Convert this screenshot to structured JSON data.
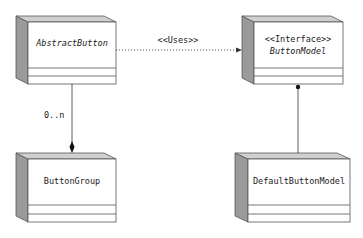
{
  "diagram": {
    "type": "UML class diagram",
    "classes": [
      {
        "id": "abstract-button",
        "name": "AbstractButton",
        "stereotype": "",
        "italic": true
      },
      {
        "id": "button-model",
        "name": "ButtonModel",
        "stereotype": "<<Interface>>",
        "italic": true
      },
      {
        "id": "button-group",
        "name": "ButtonGroup",
        "stereotype": "",
        "italic": false
      },
      {
        "id": "default-button-model",
        "name": "DefaultButtonModel",
        "stereotype": "",
        "italic": false
      }
    ],
    "relations": [
      {
        "id": "uses",
        "from": "AbstractButton",
        "to": "ButtonModel",
        "kind": "dependency",
        "label": "<<Uses>>"
      },
      {
        "id": "group-aggregation",
        "from": "AbstractButton",
        "to": "ButtonGroup",
        "kind": "composition",
        "label": "0..n"
      },
      {
        "id": "model-realization",
        "from": "DefaultButtonModel",
        "to": "ButtonModel",
        "kind": "association",
        "label": ""
      }
    ],
    "colors": {
      "box_fill": "#ffffff",
      "box_stroke": "#555555",
      "side_face": "#9a9a9a",
      "top_face": "#d0d0d0",
      "line": "#333333"
    }
  }
}
